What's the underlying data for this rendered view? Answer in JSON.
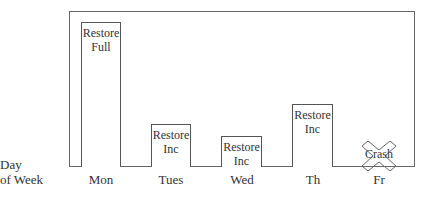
{
  "axis_label": {
    "line1": "Day",
    "line2": "of Week"
  },
  "days": [
    "Mon",
    "Tues",
    "Wed",
    "Th",
    "Fr"
  ],
  "bars": [
    {
      "day": "Mon",
      "line1": "Restore",
      "line2": "Full"
    },
    {
      "day": "Tues",
      "line1": "Restore",
      "line2": "Inc"
    },
    {
      "day": "Wed",
      "line1": "Restore",
      "line2": "Inc"
    },
    {
      "day": "Th",
      "line1": "Restore",
      "line2": "Inc"
    }
  ],
  "crash": {
    "day": "Fr",
    "label": "Crash"
  }
}
